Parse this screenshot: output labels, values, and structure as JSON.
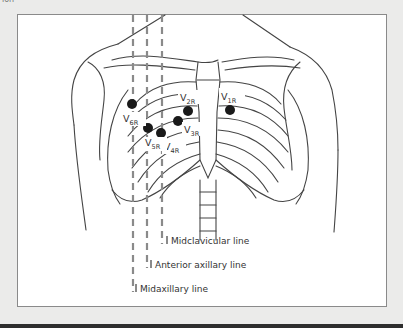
{
  "caption_fragment": "ion",
  "figure": {
    "electrodes": [
      {
        "id": "V1R",
        "letter": "V",
        "sub": "1R"
      },
      {
        "id": "V2R",
        "letter": "V",
        "sub": "2R"
      },
      {
        "id": "V3R",
        "letter": "V",
        "sub": "3R"
      },
      {
        "id": "V4R",
        "letter": "V",
        "sub": "4R"
      },
      {
        "id": "V5R",
        "letter": "V",
        "sub": "5R"
      },
      {
        "id": "V6R",
        "letter": "V",
        "sub": "6R"
      }
    ],
    "reference_lines": [
      {
        "id": "midclavicular",
        "label": "Midclavicular line"
      },
      {
        "id": "anterior-axillary",
        "label": "Anterior axillary line"
      },
      {
        "id": "midaxillary",
        "label": "Midaxillary line"
      }
    ],
    "colors": {
      "electrode": "#1a1a1a",
      "outline": "#444444",
      "dash": "#8a8a8a"
    }
  }
}
